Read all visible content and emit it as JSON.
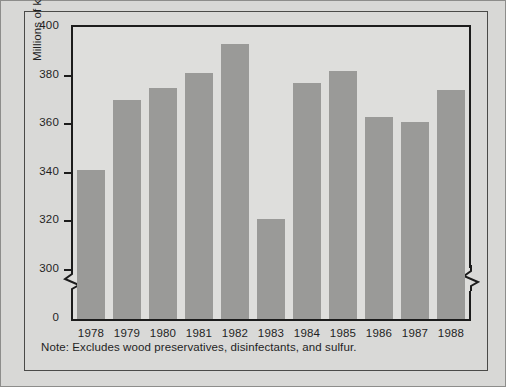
{
  "chart_data": {
    "type": "bar",
    "title": "",
    "subtitle": "",
    "xlabel": "",
    "ylabel": "Millions of kg active ingredients",
    "categories": [
      "1978",
      "1979",
      "1980",
      "1981",
      "1982",
      "1983",
      "1984",
      "1985",
      "1986",
      "1987",
      "1988"
    ],
    "values": [
      341,
      370,
      375,
      381,
      393,
      321,
      377,
      382,
      363,
      361,
      374
    ],
    "ylim": [
      0,
      400
    ],
    "yticks": [
      0,
      300,
      320,
      340,
      360,
      380,
      400
    ],
    "ytick_labels": [
      "0",
      "300",
      "320",
      "340",
      "360",
      "380",
      "400"
    ],
    "y_axis_break": true,
    "y_axis_break_between": [
      0,
      300
    ],
    "grid": false,
    "legend": null,
    "bar_color": "#9a9a98",
    "axis_color": "#1c1c1c",
    "plot_background": "#dededc",
    "figure_background": "#d8d8d6",
    "annotations": [
      "Note: Excludes wood preservatives, disinfectants, and sulfur."
    ]
  },
  "note": {
    "text": "Note: Excludes wood preservatives, disinfectants, and sulfur."
  },
  "axis": {
    "y_title": "Millions of kg active ingredients"
  }
}
